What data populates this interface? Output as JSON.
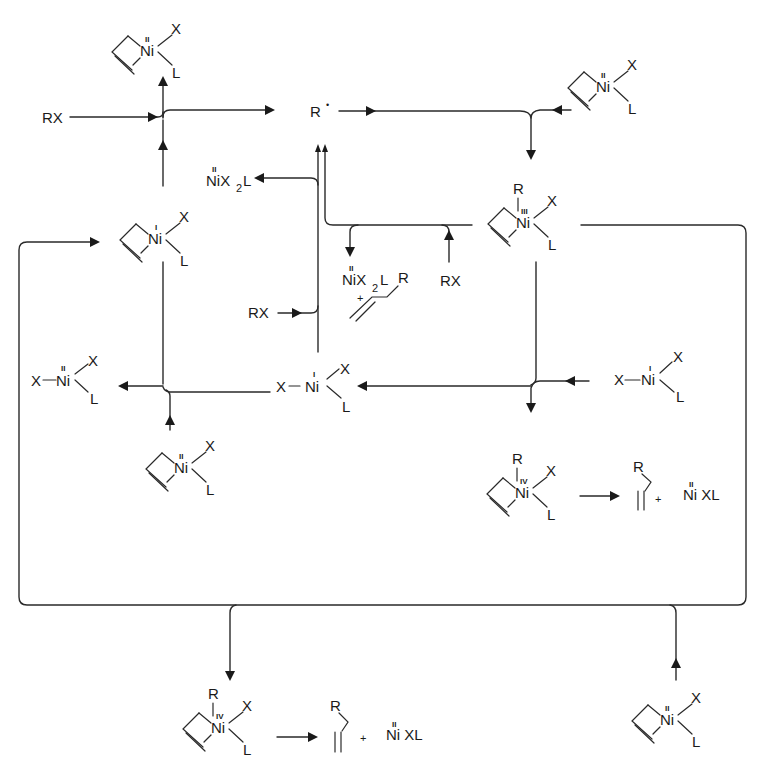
{
  "diagram": {
    "type": "catalytic-cycle",
    "stroke_color": "#2a2a2a",
    "background": "#ffffff"
  },
  "labels": {
    "rx": "RX",
    "radical": "R",
    "radical_dot": "•",
    "ni": "Ni",
    "x": "X",
    "l": "L",
    "r": "R",
    "plus": "+",
    "bond_dash": "—",
    "ox_I": "I",
    "ox_II": "II",
    "ox_III": "III",
    "ox_IV": "IV",
    "nix2l_main": "NiX",
    "nix2l_sub": "2",
    "nix2l_tail": "L",
    "nixl": "Ni XL"
  },
  "species": [
    {
      "id": "allyl-ni-ii-top-left",
      "formula": "(allyl)Ni(II)XL",
      "position": "top-left"
    },
    {
      "id": "allyl-ni-ii-top-right",
      "formula": "(allyl)Ni(II)XL",
      "position": "top-right"
    },
    {
      "id": "radical",
      "formula": "R•",
      "position": "top-center"
    },
    {
      "id": "allyl-ni-i",
      "formula": "(allyl)Ni(I)XL",
      "position": "left-middle"
    },
    {
      "id": "allyl-ni-iii-r",
      "formula": "(allyl)Ni(III)(R)XL",
      "position": "center-right"
    },
    {
      "id": "nix2l-upper",
      "formula": "Ni(II)X2L",
      "position": "upper-center"
    },
    {
      "id": "nix2l-products",
      "formula": "Ni(II)X2L + allyl-R",
      "position": "center"
    },
    {
      "id": "x-ni-ii-xl",
      "formula": "X-Ni(II)XL",
      "position": "left"
    },
    {
      "id": "x-ni-i-xl-center",
      "formula": "X-Ni(I)XL",
      "position": "center"
    },
    {
      "id": "x-ni-i-xl-right",
      "formula": "X-Ni(I)XL",
      "position": "right"
    },
    {
      "id": "allyl-ni-ii-lower-left",
      "formula": "(allyl)Ni(II)XL",
      "position": "lower-left"
    },
    {
      "id": "allyl-ni-iv-right",
      "formula": "(allyl)Ni(IV)(R)XL",
      "position": "lower-right"
    },
    {
      "id": "product-right",
      "formula": "allyl-R + Ni(II)XL",
      "position": "lower-right"
    },
    {
      "id": "allyl-ni-iv-bottom",
      "formula": "(allyl)Ni(IV)(R)XL",
      "position": "bottom-center"
    },
    {
      "id": "product-bottom",
      "formula": "allyl-R + Ni(II)XL",
      "position": "bottom-center"
    },
    {
      "id": "allyl-ni-ii-bottom-right",
      "formula": "(allyl)Ni(II)XL",
      "position": "bottom-right"
    }
  ]
}
